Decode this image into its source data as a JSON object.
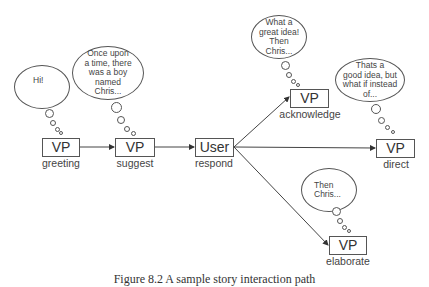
{
  "nodes": {
    "greeting": {
      "box": "VP",
      "label": "greeting",
      "thought": "Hi!"
    },
    "suggest": {
      "box": "VP",
      "label": "suggest",
      "thought": "Once upon\na time, there\nwas a boy\nnamed\nChris..."
    },
    "respond": {
      "box": "User",
      "label": "respond"
    },
    "acknowledge": {
      "box": "VP",
      "label": "acknowledge",
      "thought": "What a\ngreat idea!\nThen\nChris..."
    },
    "direct": {
      "box": "VP",
      "label": "direct",
      "thought": "Thats a\ngood idea, but\nwhat if instead\nof..."
    },
    "elaborate": {
      "box": "VP",
      "label": "elaborate",
      "thought": "Then\nChris..."
    }
  },
  "edges": [
    {
      "from": "greeting",
      "to": "suggest"
    },
    {
      "from": "suggest",
      "to": "respond"
    },
    {
      "from": "respond",
      "to": "acknowledge"
    },
    {
      "from": "respond",
      "to": "direct"
    },
    {
      "from": "respond",
      "to": "elaborate"
    }
  ],
  "caption": "Figure 8.2 A sample story interaction path"
}
